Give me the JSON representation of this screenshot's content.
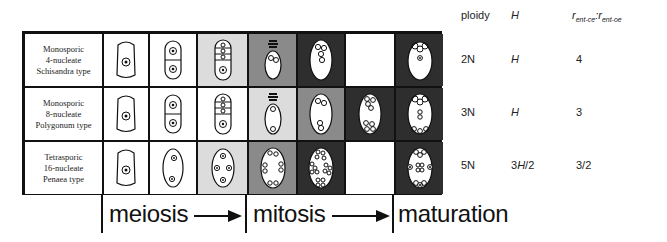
{
  "header": {
    "ploidy": "ploidy",
    "H": "H",
    "ratio_r1": "r",
    "ratio_sub1": "ent-ce",
    "ratio_sep": ":",
    "ratio_r2": "r",
    "ratio_sub2": "ent-oe"
  },
  "rows": [
    {
      "line1": "Monosporic",
      "line2": "4-nucleate",
      "line3": "Schisandra type",
      "ploidy": "2N",
      "H": "H",
      "ratio": "4",
      "cells": [
        "white",
        "white",
        "light",
        "mid",
        "dark",
        "white",
        "dark"
      ]
    },
    {
      "line1": "Monosporic",
      "line2": "8-nucleate",
      "line3": "Polygonum type",
      "ploidy": "3N",
      "H": "H",
      "ratio": "3",
      "cells": [
        "white",
        "white",
        "white",
        "light",
        "mid",
        "dark",
        "dark"
      ]
    },
    {
      "line1": "Tetrasporic",
      "line2": "16-nucleate",
      "line3": "Penaea type",
      "ploidy": "5N",
      "H_num": "3",
      "H": "H",
      "H_den": "/2",
      "ratio": "3/2",
      "cells": [
        "white",
        "white",
        "light",
        "mid",
        "dark",
        "white",
        "dark"
      ]
    }
  ],
  "phases": {
    "meiosis": "meiosis",
    "mitosis": "mitosis",
    "maturation": "maturation"
  },
  "colors": {
    "white": "#ffffff",
    "light": "#dcdcdc",
    "mid": "#8a8a8a",
    "dark": "#2e2e2e",
    "line": "#111111"
  }
}
